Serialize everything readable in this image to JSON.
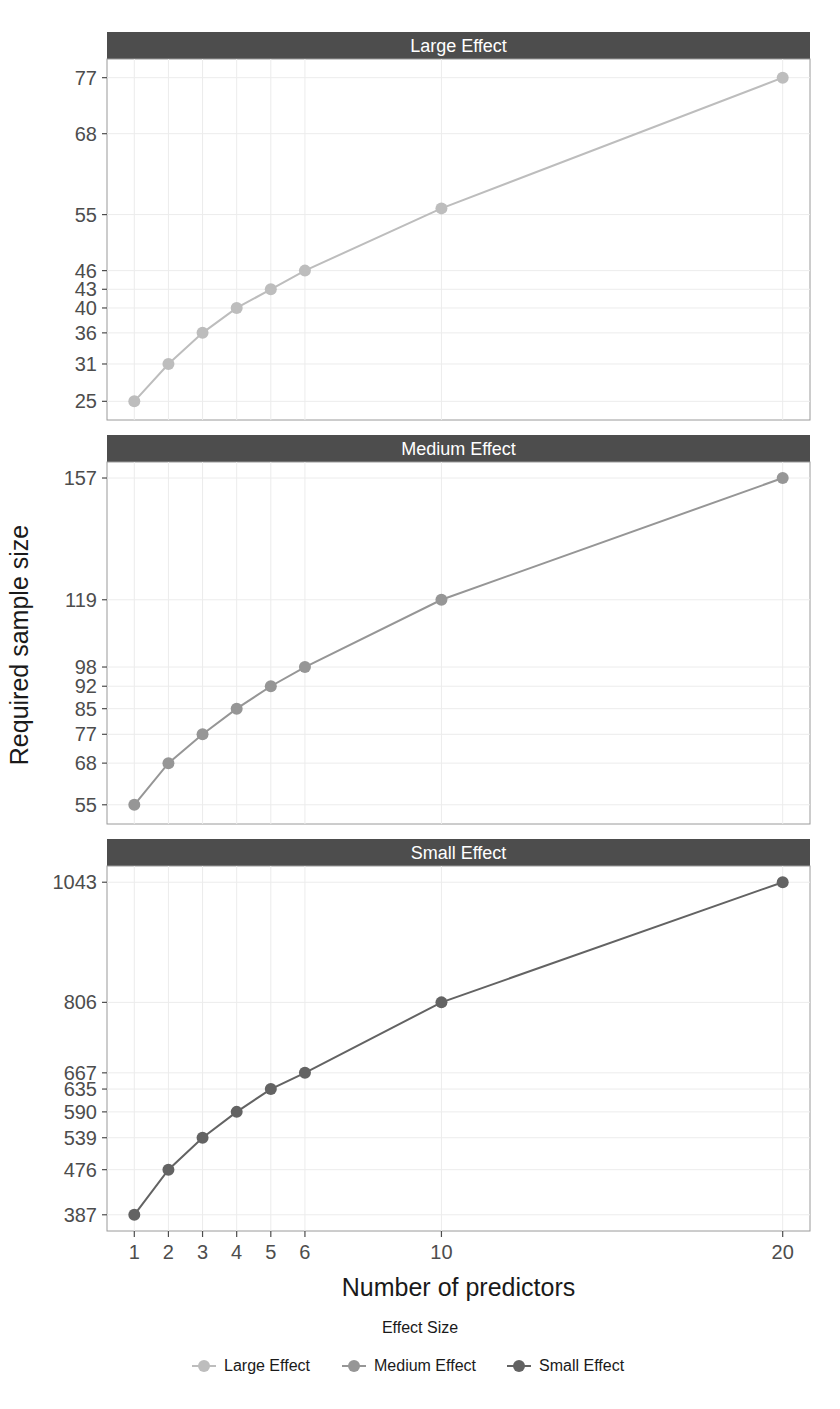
{
  "chart_data": {
    "type": "line",
    "title": "",
    "xlabel": "Number of predictors",
    "ylabel": "Required sample size",
    "x": [
      1,
      2,
      3,
      4,
      5,
      6,
      10,
      20
    ],
    "xticks": [
      "1",
      "2",
      "3",
      "4",
      "5",
      "6",
      "10",
      "20"
    ],
    "xlim": [
      0.2,
      20.8
    ],
    "legend": {
      "title": "Effect Size",
      "position": "bottom",
      "entries": [
        {
          "label": "Large Effect",
          "color": "#bdbdbd"
        },
        {
          "label": "Medium Effect",
          "color": "#969696"
        },
        {
          "label": "Small Effect",
          "color": "#636363"
        }
      ]
    },
    "facets": [
      {
        "strip": "Large Effect",
        "series_name": "Large Effect",
        "color": "#bdbdbd",
        "values": [
          25,
          31,
          36,
          40,
          43,
          46,
          56,
          77
        ],
        "yticks": [
          25,
          31,
          36,
          40,
          43,
          46,
          55,
          68,
          77
        ],
        "ytick_labels": [
          "25",
          "31",
          "36",
          "40",
          "43",
          "46",
          "55",
          "68",
          "77"
        ],
        "ylim": [
          22,
          80
        ]
      },
      {
        "strip": "Medium Effect",
        "series_name": "Medium Effect",
        "color": "#969696",
        "values": [
          55,
          68,
          77,
          85,
          92,
          98,
          119,
          157
        ],
        "yticks": [
          55,
          68,
          77,
          85,
          92,
          98,
          119,
          157
        ],
        "ytick_labels": [
          "55",
          "68",
          "77",
          "85",
          "92",
          "98",
          "119",
          "157"
        ],
        "ylim": [
          49,
          162
        ]
      },
      {
        "strip": "Small Effect",
        "series_name": "Small Effect",
        "color": "#636363",
        "values": [
          387,
          476,
          539,
          590,
          635,
          667,
          806,
          1043
        ],
        "yticks": [
          387,
          476,
          539,
          590,
          635,
          667,
          806,
          1043
        ],
        "ytick_labels": [
          "387",
          "476",
          "539",
          "590",
          "635",
          "667",
          "806",
          "1043"
        ],
        "ylim": [
          355,
          1075
        ]
      }
    ],
    "grid": true,
    "panel_background": "#ffffff",
    "strip_background": "#4d4d4d",
    "strip_text_color": "#ffffff"
  }
}
